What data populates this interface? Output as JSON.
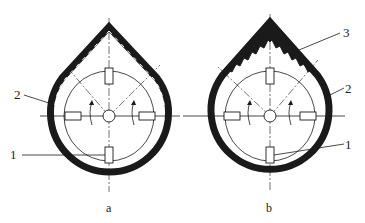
{
  "figures": [
    {
      "caption": "a",
      "callouts": [
        {
          "label": "2",
          "part": "casing"
        },
        {
          "label": "1",
          "part": "blade"
        }
      ]
    },
    {
      "caption": "b",
      "callouts": [
        {
          "label": "3",
          "part": "stepped insert"
        },
        {
          "label": "2",
          "part": "casing"
        },
        {
          "label": "1",
          "part": "blade"
        }
      ]
    }
  ],
  "colors": {
    "ink": "#1a1a1a",
    "background": "#ffffff"
  }
}
